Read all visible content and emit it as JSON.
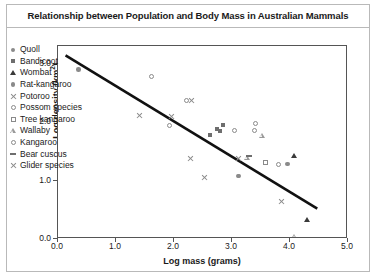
{
  "chart_data": {
    "type": "scatter",
    "title": "Relationship between Population and Body Mass in Australian Mammals",
    "xlabel": "Log mass (grams)",
    "ylabel": "Log density (km",
    "ylabel_sup": "2",
    "ylabel_tail": ")",
    "xlim": [
      0.0,
      5.0
    ],
    "ylim": [
      0.0,
      3.3
    ],
    "xticks": [
      "0.0",
      "1.0",
      "2.0",
      "3.0",
      "4.0",
      "5.0"
    ],
    "xtick_values": [
      0.0,
      1.0,
      2.0,
      3.0,
      4.0,
      5.0
    ],
    "yticks": [
      "0.0",
      "1.0",
      "2.0",
      "3.0"
    ],
    "ytick_values": [
      0.0,
      1.0,
      2.0,
      3.0
    ],
    "grid": false,
    "legend_position": "inside-left",
    "trendline": {
      "label": "regression line",
      "x_start": 0.13,
      "y_start": 3.14,
      "x_end": 4.47,
      "y_end": 0.52
    },
    "series": [
      {
        "name": "Quoll",
        "marker": "filled-circle",
        "points": [
          {
            "x": 0.35,
            "y": 2.9
          },
          {
            "x": 3.12,
            "y": 1.08
          },
          {
            "x": 3.96,
            "y": 1.28
          }
        ]
      },
      {
        "name": "Bandicoot",
        "marker": "filled-square",
        "points": [
          {
            "x": 2.62,
            "y": 1.78
          },
          {
            "x": 2.74,
            "y": 1.88
          },
          {
            "x": 2.85,
            "y": 1.95
          },
          {
            "x": 2.8,
            "y": 1.84
          }
        ]
      },
      {
        "name": "Wombat",
        "marker": "filled-triangle",
        "points": [
          {
            "x": 4.07,
            "y": 1.42
          },
          {
            "x": 4.3,
            "y": 0.34
          }
        ]
      },
      {
        "name": "Rat-kangaroo",
        "marker": "filled-circle",
        "points": [
          {
            "x": 3.1,
            "y": 1.08
          }
        ]
      },
      {
        "name": "Potoroo",
        "marker": "cross",
        "points": [
          {
            "x": 1.96,
            "y": 2.1
          },
          {
            "x": 2.3,
            "y": 2.36
          },
          {
            "x": 2.28,
            "y": 1.38
          },
          {
            "x": 2.52,
            "y": 1.06
          },
          {
            "x": 3.12,
            "y": 1.38
          },
          {
            "x": 3.86,
            "y": 0.64
          }
        ]
      },
      {
        "name": "Possum species",
        "marker": "open-circle",
        "points": [
          {
            "x": 1.62,
            "y": 2.78
          },
          {
            "x": 2.22,
            "y": 2.37
          },
          {
            "x": 3.04,
            "y": 1.86
          },
          {
            "x": 3.38,
            "y": 1.86
          },
          {
            "x": 3.4,
            "y": 1.98
          },
          {
            "x": 3.8,
            "y": 1.28
          }
        ]
      },
      {
        "name": "Tree kangaroo",
        "marker": "open-square",
        "points": [
          {
            "x": 3.58,
            "y": 1.3
          }
        ]
      },
      {
        "name": "Wallaby",
        "marker": "open-triangle",
        "points": [
          {
            "x": 3.26,
            "y": 1.4
          },
          {
            "x": 3.52,
            "y": 1.86
          },
          {
            "x": 4.08,
            "y": 0.22
          }
        ]
      },
      {
        "name": "Kangaroo",
        "marker": "open-circle",
        "points": [
          {
            "x": 1.92,
            "y": 1.94
          }
        ]
      },
      {
        "name": "Bear cuscus",
        "marker": "dash",
        "points": [
          {
            "x": 3.3,
            "y": 1.42
          }
        ]
      },
      {
        "name": "Glider species",
        "marker": "cross",
        "points": [
          {
            "x": 1.4,
            "y": 2.12
          }
        ]
      }
    ],
    "legend_entries": [
      {
        "label": "Quoll",
        "marker": "filled-circle"
      },
      {
        "label": "Bandicoot",
        "marker": "filled-square"
      },
      {
        "label": "Wombat",
        "marker": "filled-triangle"
      },
      {
        "label": "Rat-kangaroo",
        "marker": "filled-circle"
      },
      {
        "label": "Potoroo",
        "marker": "cross"
      },
      {
        "label": "Possom species",
        "marker": "open-circle"
      },
      {
        "label": "Tree kangaroo",
        "marker": "open-square"
      },
      {
        "label": "Wallaby",
        "marker": "open-triangle"
      },
      {
        "label": "Kangaroo",
        "marker": "open-circle"
      },
      {
        "label": "Bear cuscus",
        "marker": "dash"
      },
      {
        "label": "Glider species",
        "marker": "cross"
      }
    ],
    "colors": {
      "axis": "#555555",
      "trendline": "#111111",
      "marker_gray": "#8a8a8a",
      "marker_dark": "#555555",
      "frame": "#b9b9b9",
      "background": "#ffffff"
    }
  }
}
